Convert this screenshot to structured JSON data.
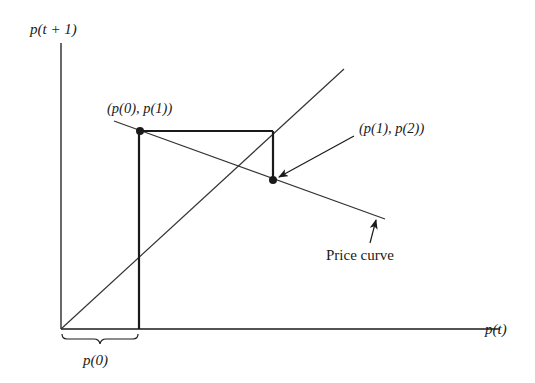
{
  "diagram": {
    "axes": {
      "y_label": "p(t + 1)",
      "x_label": "p(t)"
    },
    "lines": {
      "diagonal": "45-degree line p(t+1) = p(t)",
      "price_curve_label": "Price curve"
    },
    "points": [
      {
        "label": "(p(0), p(1))"
      },
      {
        "label": "(p(1), p(2))"
      }
    ],
    "brace_label": "p(0)",
    "colors": {
      "ink": "#1a1a1a",
      "background": "#ffffff"
    }
  }
}
